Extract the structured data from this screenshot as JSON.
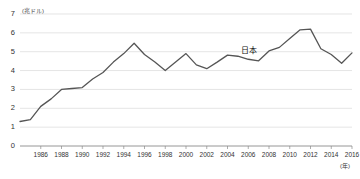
{
  "chart_data": {
    "type": "line",
    "title": "",
    "subtitle": "",
    "xlabel": "(年)",
    "ylabel": "(兆ドル)",
    "xlim": [
      1984,
      2016
    ],
    "ylim": [
      0,
      7
    ],
    "grid": true,
    "legend_position": "inline-right",
    "series": [
      {
        "name": "日本",
        "color": "#555555",
        "x": [
          1984,
          1985,
          1986,
          1987,
          1988,
          1989,
          1990,
          1991,
          1992,
          1993,
          1994,
          1995,
          1996,
          1997,
          1998,
          1999,
          2000,
          2001,
          2002,
          2003,
          2004,
          2005,
          2006,
          2007,
          2008,
          2009,
          2010,
          2011,
          2012,
          2013,
          2014,
          2015,
          2016
        ],
        "values": [
          1.3,
          1.4,
          2.1,
          2.5,
          3.0,
          3.05,
          3.1,
          3.55,
          3.9,
          4.45,
          4.9,
          5.45,
          4.85,
          4.45,
          4.0,
          4.45,
          4.9,
          4.3,
          4.1,
          4.45,
          4.82,
          4.76,
          4.6,
          4.52,
          5.04,
          5.23,
          5.7,
          6.16,
          6.2,
          5.16,
          4.85,
          4.39,
          4.94
        ]
      }
    ],
    "yticks": [
      0,
      1,
      2,
      3,
      4,
      5,
      6,
      7
    ],
    "xticks": [
      1986,
      1988,
      1990,
      1992,
      1994,
      1996,
      1998,
      2000,
      2002,
      2004,
      2006,
      2008,
      2010,
      2012,
      2014,
      2016
    ],
    "axis_color": "#8a8a8a",
    "grid_color": "#d8d8d8"
  },
  "labels": {
    "y_unit": "(兆ドル)",
    "x_unit": "(年)",
    "series_name": "日本"
  }
}
